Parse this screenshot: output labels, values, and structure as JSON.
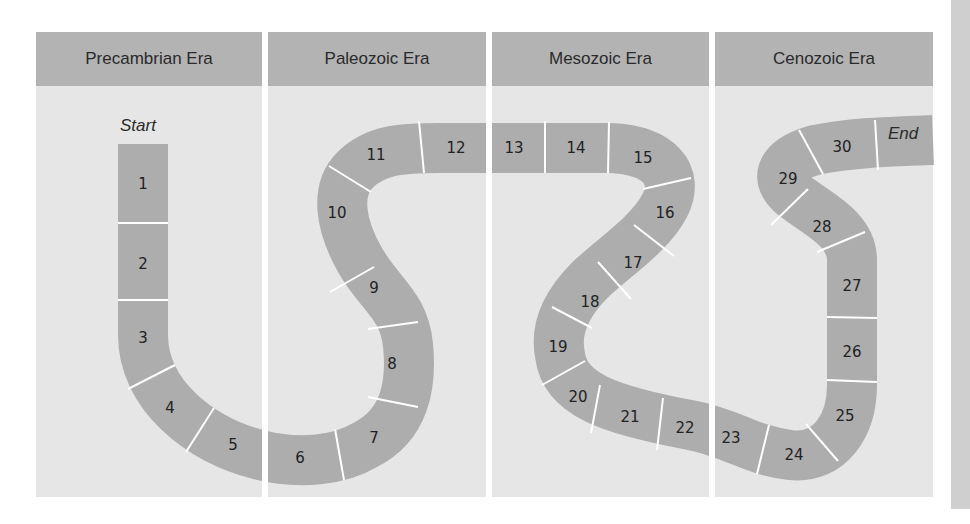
{
  "diagram": {
    "eras": [
      {
        "name": "Precambrian Era"
      },
      {
        "name": "Paleozoic Era"
      },
      {
        "name": "Mesozoic Era"
      },
      {
        "name": "Cenozoic Era"
      }
    ],
    "start_label": "Start",
    "end_label": "End",
    "tiles": [
      "1",
      "2",
      "3",
      "4",
      "5",
      "6",
      "7",
      "8",
      "9",
      "10",
      "11",
      "12",
      "13",
      "14",
      "15",
      "16",
      "17",
      "18",
      "19",
      "20",
      "21",
      "22",
      "23",
      "24",
      "25",
      "26",
      "27",
      "28",
      "29",
      "30"
    ]
  },
  "colors": {
    "panel_bg": "#e6e6e6",
    "header_bg": "#b3b3b3",
    "path_fill": "#adadad",
    "separator": "#ffffff",
    "side_strip": "#cfcfcf"
  }
}
